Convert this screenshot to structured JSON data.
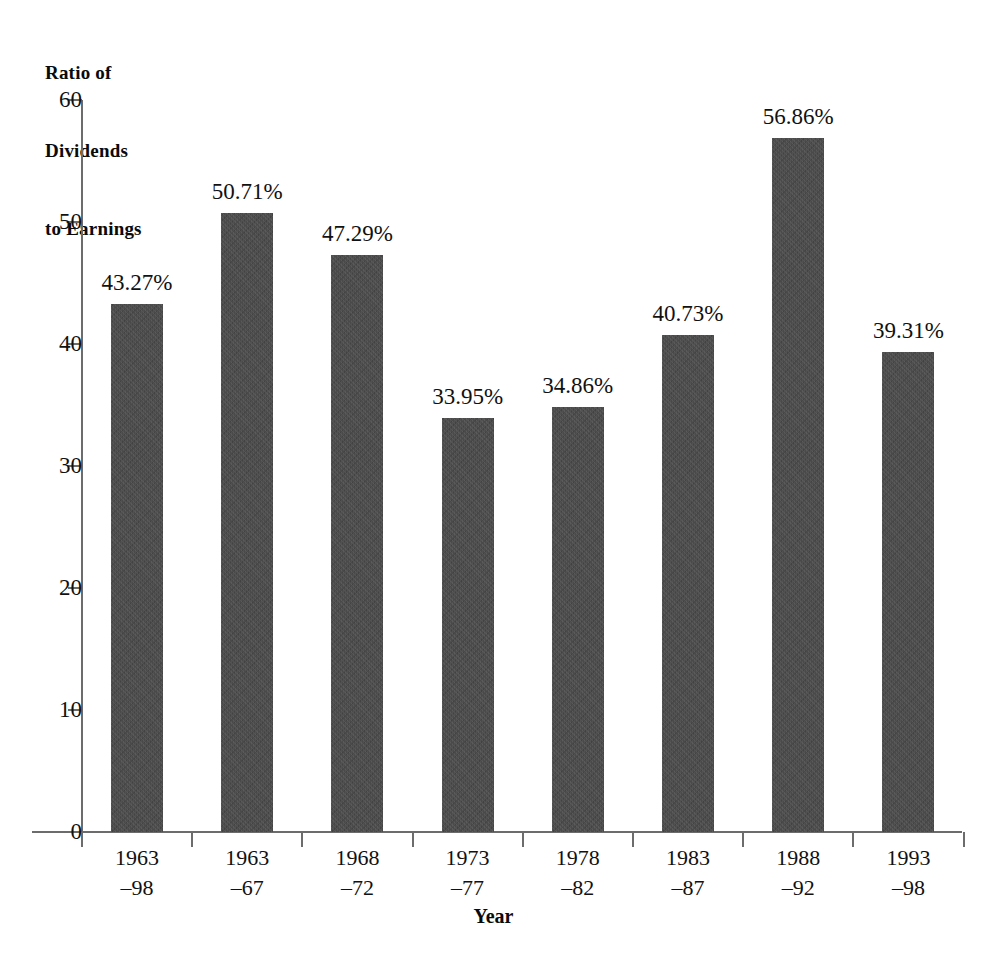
{
  "chart_data": {
    "type": "bar",
    "title": "",
    "ylabel": "Ratio of Dividends to Earnings",
    "ylabel_lines": [
      "Ratio of",
      "Dividends",
      "to Earnings"
    ],
    "xlabel": "Year",
    "ylim": [
      0,
      60
    ],
    "ytick_labels": [
      "60",
      "50",
      "40",
      "30",
      "20",
      "10",
      "0"
    ],
    "ytick_values": [
      60,
      50,
      40,
      30,
      20,
      10,
      0
    ],
    "grid": false,
    "legend": null,
    "bar_color": "#4a4a4a",
    "categories": [
      "1963–98",
      "1963–67",
      "1968–72",
      "1973–77",
      "1978–82",
      "1983–87",
      "1988–92",
      "1993–98"
    ],
    "category_lines": [
      [
        "1963",
        "–98"
      ],
      [
        "1963",
        "–67"
      ],
      [
        "1968",
        "–72"
      ],
      [
        "1973",
        "–77"
      ],
      [
        "1978",
        "–82"
      ],
      [
        "1983",
        "–87"
      ],
      [
        "1988",
        "–92"
      ],
      [
        "1993",
        "–98"
      ]
    ],
    "values": [
      43.27,
      50.71,
      47.29,
      33.95,
      34.86,
      40.73,
      56.86,
      39.31
    ],
    "value_labels": [
      "43.27%",
      "50.71%",
      "47.29%",
      "33.95%",
      "34.86%",
      "40.73%",
      "56.86%",
      "39.31%"
    ]
  },
  "axes": {
    "y_title_line1": "Ratio of",
    "y_title_line2": "Dividends",
    "y_title_line3": "to Earnings",
    "x_title": "Year"
  },
  "yticks": [
    {
      "label": "60"
    },
    {
      "label": "50"
    },
    {
      "label": "40"
    },
    {
      "label": "30"
    },
    {
      "label": "20"
    },
    {
      "label": "10"
    },
    {
      "label": "0"
    }
  ],
  "bars": [
    {
      "value_label": "43.27%",
      "cat_line1": "1963",
      "cat_line2": "–98"
    },
    {
      "value_label": "50.71%",
      "cat_line1": "1963",
      "cat_line2": "–67"
    },
    {
      "value_label": "47.29%",
      "cat_line1": "1968",
      "cat_line2": "–72"
    },
    {
      "value_label": "33.95%",
      "cat_line1": "1973",
      "cat_line2": "–77"
    },
    {
      "value_label": "34.86%",
      "cat_line1": "1978",
      "cat_line2": "–82"
    },
    {
      "value_label": "40.73%",
      "cat_line1": "1983",
      "cat_line2": "–87"
    },
    {
      "value_label": "56.86%",
      "cat_line1": "1988",
      "cat_line2": "–92"
    },
    {
      "value_label": "39.31%",
      "cat_line1": "1993",
      "cat_line2": "–98"
    }
  ]
}
